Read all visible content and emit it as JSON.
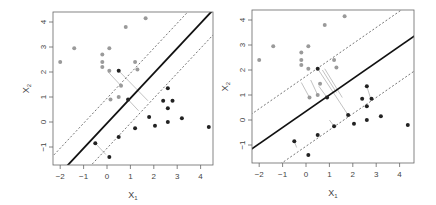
{
  "chart_data": [
    {
      "type": "scatter",
      "title": "",
      "xlabel": "X1",
      "ylabel": "X2",
      "xlim": [
        -2.2,
        4.5
      ],
      "ylim": [
        -1.7,
        4.4
      ],
      "xticks": [
        -2,
        -1,
        0,
        1,
        2,
        3,
        4
      ],
      "yticks": [
        -1,
        0,
        1,
        2,
        3,
        4
      ],
      "grid": false,
      "series": [
        {
          "name": "class-gray",
          "color": "#9a9a9a",
          "points": [
            [
              -2,
              2.4
            ],
            [
              -1.4,
              2.95
            ],
            [
              -0.2,
              2.7
            ],
            [
              -0.2,
              2.4
            ],
            [
              -0.2,
              2.2
            ],
            [
              0.1,
              2.95
            ],
            [
              0.1,
              2.05
            ],
            [
              0.8,
              3.8
            ],
            [
              1.65,
              4.15
            ],
            [
              1.2,
              2.4
            ],
            [
              1.3,
              2.1
            ],
            [
              0.6,
              1.45
            ],
            [
              0.5,
              1.0
            ],
            [
              0.15,
              0.9
            ]
          ]
        },
        {
          "name": "class-black",
          "color": "#222222",
          "points": [
            [
              0.5,
              2.05
            ],
            [
              0.9,
              0.9
            ],
            [
              2.6,
              1.35
            ],
            [
              2.4,
              0.85
            ],
            [
              2.8,
              0.85
            ],
            [
              2.6,
              0.55
            ],
            [
              1.8,
              0.2
            ],
            [
              2.05,
              -0.15
            ],
            [
              2.6,
              0
            ],
            [
              3.2,
              0.15
            ],
            [
              4.35,
              -0.2
            ],
            [
              1.2,
              -0.25
            ],
            [
              0.5,
              -0.6
            ],
            [
              -0.5,
              -0.85
            ],
            [
              0.1,
              -1.4
            ]
          ]
        }
      ],
      "hyperplane": {
        "slope": 1.0,
        "intercept": -0.05
      },
      "margin_offset": 1.0,
      "slack_segments": [
        [
          [
            0.5,
            2.05
          ],
          [
            1.75,
            0.85
          ]
        ],
        [
          [
            0.9,
            0.9
          ],
          [
            1.35,
            0.45
          ]
        ],
        [
          [
            -0.5,
            -0.85
          ],
          [
            -0.05,
            -1.3
          ]
        ],
        [
          [
            0.6,
            1.45
          ],
          [
            0.05,
            2.0
          ]
        ]
      ]
    },
    {
      "type": "scatter",
      "title": "",
      "xlabel": "X1",
      "ylabel": "X2",
      "xlim": [
        -2.2,
        4.5
      ],
      "ylim": [
        -1.7,
        4.4
      ],
      "xticks": [
        -2,
        -1,
        0,
        1,
        2,
        3,
        4
      ],
      "yticks": [
        -1,
        0,
        1,
        2,
        3,
        4
      ],
      "grid": false,
      "series": [
        {
          "name": "class-gray",
          "color": "#9a9a9a",
          "points": [
            [
              -2,
              2.4
            ],
            [
              -1.4,
              2.95
            ],
            [
              -0.2,
              2.7
            ],
            [
              -0.2,
              2.4
            ],
            [
              -0.2,
              2.2
            ],
            [
              0.1,
              2.95
            ],
            [
              0.1,
              2.05
            ],
            [
              0.8,
              3.8
            ],
            [
              1.65,
              4.15
            ],
            [
              1.2,
              2.4
            ],
            [
              1.3,
              2.1
            ],
            [
              0.6,
              1.45
            ],
            [
              0.5,
              1.0
            ],
            [
              0.15,
              0.9
            ]
          ]
        },
        {
          "name": "class-black",
          "color": "#222222",
          "points": [
            [
              0.5,
              2.05
            ],
            [
              0.9,
              0.9
            ],
            [
              2.6,
              1.35
            ],
            [
              2.4,
              0.85
            ],
            [
              2.8,
              0.85
            ],
            [
              2.6,
              0.55
            ],
            [
              1.8,
              0.2
            ],
            [
              2.05,
              -0.15
            ],
            [
              2.6,
              0
            ],
            [
              3.2,
              0.15
            ],
            [
              4.35,
              -0.2
            ],
            [
              1.2,
              -0.25
            ],
            [
              0.5,
              -0.6
            ],
            [
              -0.5,
              -0.85
            ],
            [
              0.1,
              -1.4
            ]
          ]
        }
      ],
      "hyperplane": {
        "slope": 0.65,
        "intercept": 0.35
      },
      "margin_offset": 1.4,
      "slack_segments": [
        [
          [
            0.5,
            2.05
          ],
          [
            1.8,
            0.2
          ]
        ],
        [
          [
            0.9,
            0.9
          ],
          [
            0.55,
            1.35
          ]
        ],
        [
          [
            -0.2,
            1.5
          ],
          [
            0.15,
            0.9
          ]
        ],
        [
          [
            0.2,
            1.6
          ],
          [
            0.5,
            1.0
          ]
        ],
        [
          [
            0.7,
            2.0
          ],
          [
            1.3,
            1.1
          ]
        ],
        [
          [
            0.8,
            2.05
          ],
          [
            1.55,
            0.9
          ]
        ],
        [
          [
            1.2,
            -0.25
          ],
          [
            1.0,
            0.0
          ]
        ],
        [
          [
            -0.5,
            -0.85
          ],
          [
            -0.4,
            -1.1
          ]
        ],
        [
          [
            2.6,
            1.35
          ],
          [
            2.75,
            0.9
          ]
        ]
      ]
    }
  ],
  "panels": [
    {
      "xlabel": "X",
      "xsub": "1",
      "ylabel": "X",
      "ysub": "2"
    },
    {
      "xlabel": "X",
      "xsub": "1",
      "ylabel": "X",
      "ysub": "2"
    }
  ]
}
